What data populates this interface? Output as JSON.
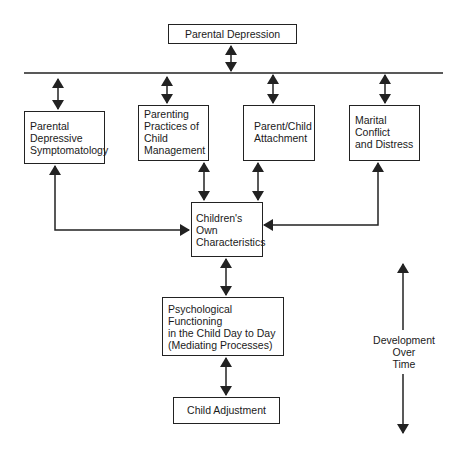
{
  "diagram": {
    "top": {
      "label": "Parental Depression"
    },
    "pathways": [
      {
        "id": "symptomatology",
        "lines": [
          "Parental",
          "Depressive",
          "Symptomatology"
        ]
      },
      {
        "id": "parenting",
        "lines": [
          "Parenting",
          "Practices of",
          "Child",
          "Management"
        ]
      },
      {
        "id": "attachment",
        "lines": [
          "Parent/Child",
          "Attachment"
        ]
      },
      {
        "id": "marital",
        "lines": [
          "Marital",
          "Conflict",
          "and Distress"
        ]
      }
    ],
    "child_characteristics": {
      "lines": [
        "Children's",
        "Own",
        "Characteristics"
      ]
    },
    "mediating": {
      "lines": [
        "Psychological",
        "Functioning",
        "in the Child Day to Day",
        "(Mediating Processes)"
      ]
    },
    "outcome": {
      "label": "Child Adjustment"
    },
    "time_axis": {
      "lines": [
        "Development",
        "Over",
        "Time"
      ]
    },
    "colors": {
      "line": "#222222",
      "background": "#ffffff"
    }
  }
}
